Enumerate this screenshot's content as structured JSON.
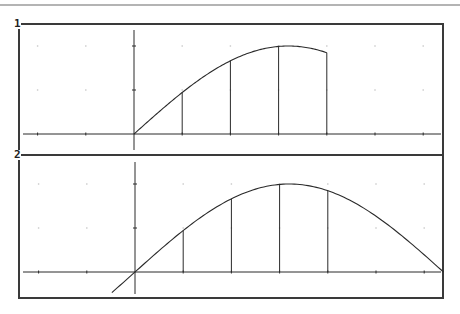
{
  "header": {
    "rule_color": "#6a6a6a"
  },
  "colors": {
    "ink": "#2a2a2a",
    "border": "#3a3a3a",
    "grid_dot": "#c8c8c8",
    "background": "#ffffff"
  },
  "panels": [
    {
      "label": "1",
      "id": "panel-1"
    },
    {
      "label": "2",
      "id": "panel-2"
    }
  ],
  "chart_data": [
    {
      "type": "line",
      "title": "",
      "panel": "1",
      "description": "Function graph with Riemann-sum vertical lines, plotted from x=0 to x=4",
      "function_approx": "y = 2*sin(pi*x/6.4)",
      "xlabel": "",
      "ylabel": "",
      "x_tick_spacing": 1,
      "y_tick_spacing": 1,
      "xlim": [
        -2.4,
        6.4
      ],
      "ylim": [
        -0.4,
        2.4
      ],
      "grid": "dots",
      "x": [
        0,
        0.5,
        1,
        1.5,
        2,
        2.5,
        3,
        3.5,
        4
      ],
      "y": [
        0,
        0.48,
        0.94,
        1.36,
        1.66,
        1.88,
        1.99,
        1.99,
        1.85
      ],
      "vertical_lines_x": [
        1,
        2,
        3,
        4
      ]
    },
    {
      "type": "line",
      "title": "",
      "panel": "2",
      "description": "Same function graphed over full domain with vertical lines at integer x",
      "function_approx": "y = 2*sin(pi*x/6.4)",
      "xlabel": "",
      "ylabel": "",
      "x_tick_spacing": 1,
      "y_tick_spacing": 1,
      "xlim": [
        -2.4,
        6.4
      ],
      "ylim": [
        -0.6,
        2.5
      ],
      "grid": "dots",
      "x": [
        -0.48,
        0,
        0.5,
        1,
        1.5,
        2,
        2.5,
        3,
        3.5,
        4,
        4.5,
        5,
        5.5,
        6,
        6.4
      ],
      "y": [
        -0.46,
        0,
        0.48,
        0.94,
        1.36,
        1.66,
        1.88,
        1.99,
        1.99,
        1.85,
        1.6,
        1.26,
        0.86,
        0.39,
        0
      ],
      "vertical_lines_x": [
        1,
        2,
        3,
        4
      ]
    }
  ]
}
